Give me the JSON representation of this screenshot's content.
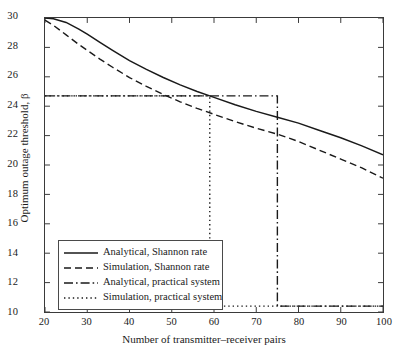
{
  "chart_data": {
    "type": "line",
    "title": "",
    "xlabel": "Number of transmitter–receiver pairs",
    "ylabel": "Optimum outage threshold, β",
    "xlim": [
      20,
      100
    ],
    "ylim": [
      10,
      30
    ],
    "xticks": [
      20,
      30,
      40,
      50,
      60,
      70,
      80,
      90,
      100
    ],
    "yticks": [
      10,
      12,
      14,
      16,
      18,
      20,
      22,
      24,
      26,
      28,
      30
    ],
    "grid": false,
    "legend_position": "lower-left-inside",
    "series": [
      {
        "name": "Analytical, Shannon rate",
        "style": "solid",
        "color": "#1a1a1a",
        "x": [
          20,
          22,
          25,
          28,
          30,
          33,
          36,
          40,
          44,
          48,
          52,
          56,
          60,
          65,
          70,
          75,
          80,
          85,
          90,
          95,
          100
        ],
        "y": [
          30.0,
          29.95,
          29.7,
          29.25,
          28.9,
          28.35,
          27.8,
          27.1,
          26.5,
          25.95,
          25.45,
          25.0,
          24.6,
          24.1,
          23.65,
          23.25,
          22.85,
          22.35,
          21.85,
          21.3,
          20.7
        ]
      },
      {
        "name": "Simulation, Shannon rate",
        "style": "dashed",
        "color": "#1a1a1a",
        "x": [
          20,
          22,
          25,
          28,
          30,
          33,
          36,
          40,
          44,
          48,
          52,
          56,
          60,
          65,
          70,
          75,
          80,
          85,
          90,
          95,
          100
        ],
        "y": [
          29.85,
          29.5,
          28.85,
          28.2,
          27.8,
          27.2,
          26.65,
          25.95,
          25.35,
          24.8,
          24.3,
          23.85,
          23.45,
          22.95,
          22.5,
          22.1,
          21.6,
          21.0,
          20.4,
          19.8,
          19.1
        ]
      },
      {
        "name": "Analytical, practical system",
        "style": "dashdot",
        "color": "#1a1a1a",
        "x": [
          20,
          75,
          75,
          100
        ],
        "y": [
          24.7,
          24.7,
          10.4,
          10.4
        ],
        "step_drop_x": 75,
        "high_level": 24.7,
        "low_level": 10.4
      },
      {
        "name": "Simulation, practical system",
        "style": "dotted",
        "color": "#1a1a1a",
        "x": [
          20,
          59,
          59,
          100
        ],
        "y": [
          24.7,
          24.7,
          10.4,
          10.4
        ],
        "step_drop_x": 59,
        "high_level": 24.7,
        "low_level": 10.4
      }
    ]
  },
  "legend": {
    "items": [
      {
        "label": "Analytical, Shannon rate"
      },
      {
        "label": "Simulation, Shannon rate"
      },
      {
        "label": "Analytical, practical system"
      },
      {
        "label": "Simulation, practical system"
      }
    ]
  },
  "axes": {
    "xtick_labels": [
      "20",
      "30",
      "40",
      "50",
      "60",
      "70",
      "80",
      "90",
      "100"
    ],
    "ytick_labels": [
      "10",
      "12",
      "14",
      "16",
      "18",
      "20",
      "22",
      "24",
      "26",
      "28",
      "30"
    ],
    "xlabel": "Number of transmitter–receiver pairs",
    "ylabel": "Optimum outage threshold, β"
  },
  "colors": {
    "line": "#1a1a1a",
    "frame": "#3a3a3a",
    "background": "#ffffff"
  }
}
